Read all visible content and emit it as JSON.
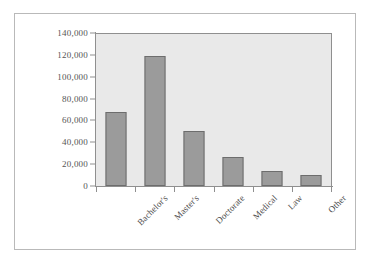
{
  "chart_data": {
    "type": "bar",
    "title": "",
    "subtitle": "",
    "xlabel": "",
    "ylabel": "",
    "categories": [
      "Bachelor's",
      "Master's",
      "Doctorate",
      "Medical",
      "Law",
      "Other"
    ],
    "values": [
      68000,
      119000,
      50000,
      26500,
      13500,
      10000
    ],
    "ylim": [
      0,
      140000
    ],
    "ytick_values": [
      0,
      20000,
      40000,
      60000,
      80000,
      100000,
      120000,
      140000
    ],
    "ytick_labels": [
      "0",
      "20,000",
      "40,000",
      "60,000",
      "80,000",
      "100,000",
      "120,000",
      "140,000"
    ],
    "grid": false,
    "legend": null,
    "legend_position": "none",
    "annotations": [],
    "colors": {
      "bar_fill": "#9b9b9b",
      "bar_edge": "#6d6d6d",
      "plot_background": "#e9e9e9",
      "figure_background": "#ffffff",
      "axis_line": "#8f8f8f",
      "tick_label": "#555555",
      "frame_border": "#b9b9b9"
    }
  }
}
